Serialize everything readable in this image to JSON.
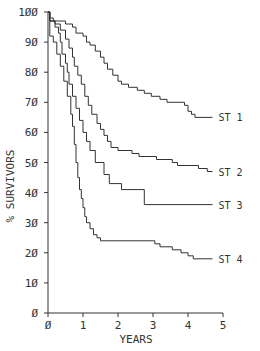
{
  "chart_data": {
    "type": "line",
    "subtype": "kaplan-meier step",
    "title": "",
    "xlabel": "YEARS",
    "ylabel": "% SURVIVORS",
    "xlim": [
      0,
      5
    ],
    "ylim": [
      0,
      100
    ],
    "xticks": [
      "0",
      "1",
      "2",
      "3",
      "4",
      "5"
    ],
    "yticks": [
      "0",
      "10",
      "20",
      "30",
      "40",
      "50",
      "60",
      "70",
      "80",
      "90",
      "100"
    ],
    "grid": false,
    "legend": "inline labels at right end of each curve",
    "series": [
      {
        "name": "ST 1",
        "x": [
          0,
          0.05,
          0.15,
          0.5,
          0.7,
          0.8,
          1.0,
          1.1,
          1.2,
          1.35,
          1.5,
          1.6,
          1.7,
          1.85,
          2.0,
          2.1,
          2.3,
          2.55,
          2.75,
          2.95,
          3.2,
          3.4,
          3.9,
          4.0,
          4.1,
          4.2,
          4.7
        ],
        "values": [
          100,
          98,
          97,
          96,
          95,
          93,
          92,
          90,
          89,
          87,
          85,
          83,
          81,
          79,
          77,
          76,
          75,
          74,
          73,
          72,
          71,
          70,
          69,
          67,
          66,
          65,
          65
        ]
      },
      {
        "name": "ST 2",
        "x": [
          0,
          0.05,
          0.2,
          0.35,
          0.5,
          0.6,
          0.7,
          0.75,
          0.85,
          0.95,
          1.05,
          1.15,
          1.25,
          1.4,
          1.5,
          1.6,
          1.7,
          1.8,
          2.0,
          2.4,
          2.6,
          3.1,
          3.55,
          3.7,
          4.3,
          4.55,
          4.7
        ],
        "values": [
          100,
          97,
          96,
          94,
          91,
          88,
          85,
          82,
          79,
          76,
          72,
          69,
          66,
          63,
          61,
          59,
          57,
          55,
          54,
          53,
          52,
          51,
          50,
          49,
          48,
          47,
          47
        ]
      },
      {
        "name": "ST 3",
        "x": [
          0,
          0.05,
          0.2,
          0.3,
          0.35,
          0.4,
          0.5,
          0.55,
          0.6,
          0.7,
          0.8,
          0.9,
          1.0,
          1.1,
          1.2,
          1.35,
          1.6,
          1.75,
          2.1,
          2.75,
          4.7
        ],
        "values": [
          100,
          97,
          95,
          93,
          90,
          86,
          83,
          80,
          76,
          72,
          68,
          64,
          60,
          57,
          54,
          50,
          46,
          43,
          41,
          36,
          36
        ]
      },
      {
        "name": "ST 4",
        "x": [
          0,
          0.05,
          0.15,
          0.25,
          0.35,
          0.45,
          0.55,
          0.65,
          0.7,
          0.75,
          0.8,
          0.85,
          0.9,
          0.95,
          1.0,
          1.05,
          1.1,
          1.2,
          1.3,
          1.4,
          1.5,
          3.05,
          3.2,
          3.55,
          3.8,
          4.0,
          4.15,
          4.7
        ],
        "values": [
          100,
          92,
          90,
          86,
          82,
          77,
          72,
          66,
          62,
          56,
          50,
          45,
          41,
          38,
          35,
          32,
          30,
          28,
          26,
          25,
          24,
          23,
          22,
          21,
          20,
          19,
          18,
          18
        ]
      }
    ],
    "colors": {
      "line": "#333333",
      "axis": "#333333",
      "background": "#ffffff"
    }
  }
}
